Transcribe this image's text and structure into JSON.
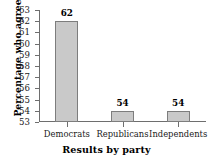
{
  "chart_data": {
    "type": "bar",
    "title": "",
    "xlabel": "Results by party",
    "ylabel": "Percentage who agree",
    "categories": [
      "Democrats",
      "Republicans",
      "Independents"
    ],
    "values": [
      62,
      54,
      54
    ],
    "value_labels": [
      "62",
      "54",
      "54"
    ],
    "ylim": [
      53,
      63
    ],
    "yticks": [
      53,
      54,
      55,
      56,
      57,
      58,
      59,
      60,
      61,
      62,
      63
    ],
    "ytick_labels": [
      "53",
      "54",
      "55",
      "56",
      "57",
      "58",
      "59",
      "60",
      "61",
      "62",
      "63"
    ],
    "grid": false,
    "legend": null,
    "colors": {
      "bar_fill": "#c9c9c9",
      "bar_edge": "#7d7d7d",
      "axis": "#6e6e6e",
      "text": "#1a1a1a",
      "background": "#ffffff"
    }
  }
}
